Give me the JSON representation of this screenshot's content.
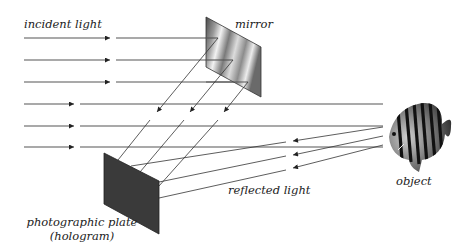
{
  "figure": {
    "labels": {
      "incident_light": "incident light",
      "mirror": "mirror",
      "object": "object",
      "reflected_light": "reflected light",
      "plate_line1": "photographic plate",
      "plate_line2": "(hologram)"
    },
    "components": [
      {
        "name": "mirror",
        "shape": "parallelogram",
        "fill": "metallic-gray gradient"
      },
      {
        "name": "photographic plate",
        "shape": "parallelogram",
        "fill": "#3a3a3a"
      },
      {
        "name": "object",
        "shape": "striped fish",
        "fill": "black/white stripes"
      }
    ],
    "beams": {
      "incident_count": 6,
      "reference_beams_from_mirror": 3,
      "object_beams_from_fish": 3
    },
    "colors": {
      "beam": "#555555",
      "plate": "#3a3a3a",
      "text": "#222222"
    }
  }
}
